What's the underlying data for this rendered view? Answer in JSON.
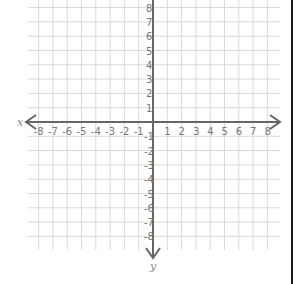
{
  "diagram": {
    "type": "coordinate-plane",
    "x_axis_label": "x",
    "y_axis_label": "y",
    "x_ticks": [
      -8,
      -7,
      -6,
      -5,
      -4,
      -3,
      -2,
      -1,
      1,
      2,
      3,
      4,
      5,
      6,
      7,
      8
    ],
    "y_ticks": [
      8,
      7,
      6,
      5,
      4,
      3,
      2,
      1,
      -1,
      -2,
      -3,
      -4,
      -5,
      -6,
      -7,
      -8
    ],
    "x_range": [
      -8,
      8
    ],
    "y_range": [
      -8,
      8
    ],
    "grid": true,
    "colors": {
      "grid": "#d9d9d9",
      "axis": "#666666",
      "tick_text": "#777777",
      "border": "#1a1a1a"
    }
  }
}
